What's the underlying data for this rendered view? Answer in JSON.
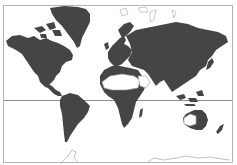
{
  "map": {
    "projection": "Mercator world map",
    "colors": {
      "land": "#454545",
      "land_light": "#ffffff",
      "outline": "#9a9a9a",
      "frame": "#b5b5b5",
      "equator": "#8c8c8c",
      "background": "#ffffff"
    },
    "features": [
      "North America",
      "South America",
      "Greenland",
      "Europe",
      "Africa",
      "Asia",
      "Australia",
      "Antarctica",
      "Equator line"
    ]
  }
}
